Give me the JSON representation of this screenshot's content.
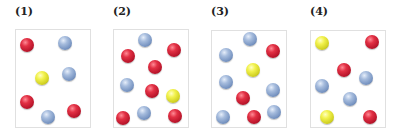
{
  "colors": {
    "red": "#d8283a",
    "blue": "#8fa8cc",
    "yellow": "#e6e640"
  },
  "panels": [
    {
      "label": "(1)",
      "box": {
        "x": 15,
        "y": 29,
        "w": 76,
        "h": 99
      },
      "balls": [
        {
          "color": "red",
          "x": 27,
          "y": 45
        },
        {
          "color": "blue",
          "x": 65,
          "y": 43
        },
        {
          "color": "yellow",
          "x": 42,
          "y": 78
        },
        {
          "color": "blue",
          "x": 69,
          "y": 74
        },
        {
          "color": "red",
          "x": 27,
          "y": 102
        },
        {
          "color": "blue",
          "x": 48,
          "y": 117
        },
        {
          "color": "red",
          "x": 74,
          "y": 111
        }
      ]
    },
    {
      "label": "(2)",
      "box": {
        "x": 113,
        "y": 29,
        "w": 76,
        "h": 99
      },
      "balls": [
        {
          "color": "blue",
          "x": 145,
          "y": 40
        },
        {
          "color": "red",
          "x": 128,
          "y": 56
        },
        {
          "color": "red",
          "x": 174,
          "y": 50
        },
        {
          "color": "red",
          "x": 155,
          "y": 67
        },
        {
          "color": "blue",
          "x": 127,
          "y": 85
        },
        {
          "color": "red",
          "x": 152,
          "y": 91
        },
        {
          "color": "yellow",
          "x": 173,
          "y": 96
        },
        {
          "color": "red",
          "x": 123,
          "y": 118
        },
        {
          "color": "blue",
          "x": 144,
          "y": 113
        },
        {
          "color": "red",
          "x": 175,
          "y": 116
        }
      ]
    },
    {
      "label": "(3)",
      "box": {
        "x": 211,
        "y": 30,
        "w": 76,
        "h": 98
      },
      "balls": [
        {
          "color": "blue",
          "x": 250,
          "y": 39
        },
        {
          "color": "blue",
          "x": 226,
          "y": 55
        },
        {
          "color": "red",
          "x": 273,
          "y": 51
        },
        {
          "color": "yellow",
          "x": 253,
          "y": 70
        },
        {
          "color": "blue",
          "x": 226,
          "y": 82
        },
        {
          "color": "blue",
          "x": 273,
          "y": 90
        },
        {
          "color": "red",
          "x": 243,
          "y": 98
        },
        {
          "color": "blue",
          "x": 223,
          "y": 117
        },
        {
          "color": "red",
          "x": 254,
          "y": 117
        },
        {
          "color": "blue",
          "x": 274,
          "y": 112
        }
      ]
    },
    {
      "label": "(4)",
      "box": {
        "x": 310,
        "y": 30,
        "w": 76,
        "h": 98
      },
      "balls": [
        {
          "color": "yellow",
          "x": 322,
          "y": 43
        },
        {
          "color": "red",
          "x": 372,
          "y": 42
        },
        {
          "color": "red",
          "x": 344,
          "y": 70
        },
        {
          "color": "blue",
          "x": 366,
          "y": 78
        },
        {
          "color": "blue",
          "x": 322,
          "y": 86
        },
        {
          "color": "blue",
          "x": 350,
          "y": 99
        },
        {
          "color": "yellow",
          "x": 327,
          "y": 117
        },
        {
          "color": "red",
          "x": 370,
          "y": 117
        }
      ]
    }
  ]
}
